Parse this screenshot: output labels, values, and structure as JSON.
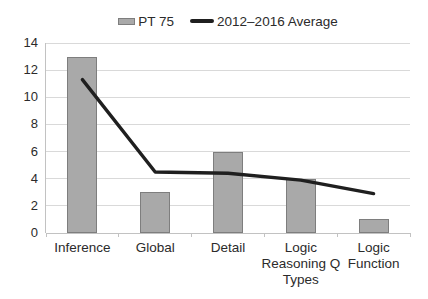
{
  "chart_data": {
    "type": "bar",
    "title": "",
    "xlabel": "",
    "ylabel": "",
    "categories": [
      "Inference",
      "Global",
      "Detail",
      "Logic\nReasoning Q\nTypes",
      "Logic\nFunction"
    ],
    "series": [
      {
        "name": "PT 75",
        "type": "bar",
        "values": [
          13,
          3,
          6,
          4,
          1
        ]
      },
      {
        "name": "2012–2016 Average",
        "type": "line",
        "values": [
          11.3,
          4.5,
          4.4,
          3.9,
          2.9
        ]
      }
    ],
    "ylim": [
      0,
      14
    ],
    "yticks": [
      0,
      2,
      4,
      6,
      8,
      10,
      12,
      14
    ],
    "grid": true,
    "legend_position": "top-center",
    "colors": {
      "bar_fill": "#a9a9a9",
      "bar_border": "#7e7e7e",
      "line": "#1f1f1f",
      "grid": "#d9d9d9",
      "axis": "#c2c2c2",
      "text": "#2b2b2b"
    }
  },
  "legend": {
    "items": [
      {
        "label": "PT 75",
        "swatch": "bar"
      },
      {
        "label": "2012–2016 Average",
        "swatch": "line"
      }
    ]
  }
}
